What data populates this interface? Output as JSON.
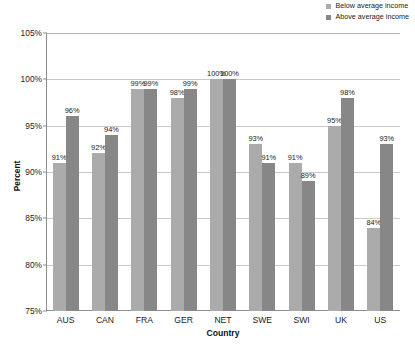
{
  "chart_data": {
    "type": "bar",
    "title": "",
    "xlabel": "Country",
    "ylabel": "Percent",
    "ylim": [
      75,
      105
    ],
    "ytick_labels": [
      "105%",
      "100%",
      "95%",
      "90%",
      "85%",
      "80%",
      "75%"
    ],
    "ytick_values": [
      105,
      100,
      95,
      90,
      85,
      80,
      75
    ],
    "grid": true,
    "legend_position": "top-right",
    "categories": [
      "AUS",
      "CAN",
      "FRA",
      "GER",
      "NET",
      "SWE",
      "SWI",
      "UK",
      "US"
    ],
    "series": [
      {
        "name": "Below average income",
        "color": "#ababab",
        "values": [
          91,
          92,
          99,
          98,
          100,
          93,
          91,
          95,
          84
        ],
        "labels": [
          "91%",
          "92%",
          "99%",
          "98%",
          "100%",
          "93%",
          "91%",
          "95%",
          "84%"
        ]
      },
      {
        "name": "Above average income",
        "color": "#878787",
        "values": [
          96,
          94,
          99,
          99,
          100,
          91,
          89,
          98,
          93
        ],
        "labels": [
          "96%",
          "94%",
          "99%",
          "99%",
          "100%",
          "91%",
          "89%",
          "98%",
          "93%"
        ]
      }
    ]
  },
  "legend": {
    "items": [
      {
        "label": "Below average income",
        "color": "#ababab"
      },
      {
        "label": "Above average income",
        "color": "#878787"
      }
    ]
  },
  "axes": {
    "y_title": "Percent",
    "x_title": "Country"
  }
}
